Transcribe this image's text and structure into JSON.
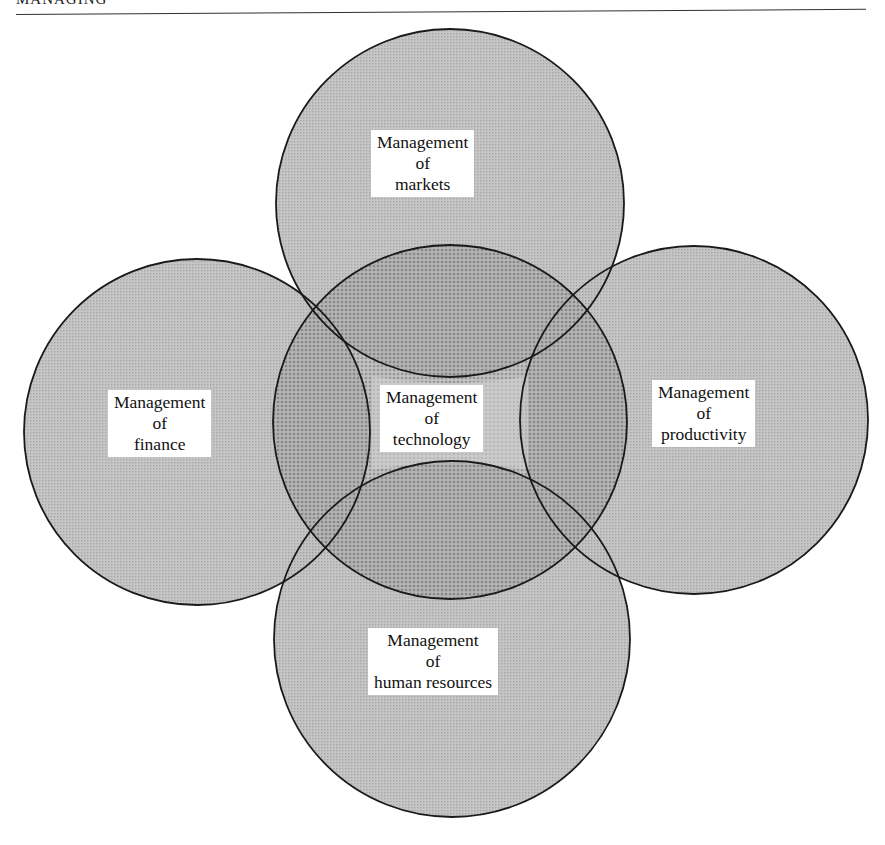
{
  "page": {
    "running_header": "MANAGING"
  },
  "diagram": {
    "title": "",
    "colors": {
      "outline": "#1a1a1a",
      "single_fill": "#c9c9c9",
      "center_fill": "#9c9c9c",
      "label_bg": "#ffffff",
      "text": "#111111"
    },
    "circles": [
      {
        "id": "markets",
        "lines": [
          "Management",
          "of",
          "markets"
        ]
      },
      {
        "id": "finance",
        "lines": [
          "Management",
          "of",
          "finance"
        ]
      },
      {
        "id": "technology",
        "lines": [
          "Management",
          "of",
          "technology"
        ]
      },
      {
        "id": "productivity",
        "lines": [
          "Management",
          "of",
          "productivity"
        ]
      },
      {
        "id": "human-resources",
        "lines": [
          "Management",
          "of",
          "human resources"
        ]
      }
    ]
  }
}
